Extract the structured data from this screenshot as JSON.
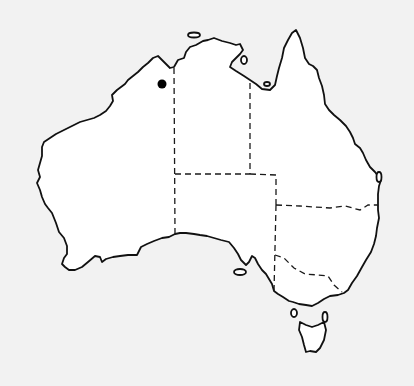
{
  "map": {
    "subject": "Australia outline with state borders",
    "background_color": "#f2f2f2",
    "land_color": "#ffffff",
    "outline_color": "#111111",
    "regions": [
      {
        "name": "Western Australia"
      },
      {
        "name": "Northern Territory"
      },
      {
        "name": "Queensland"
      },
      {
        "name": "South Australia"
      },
      {
        "name": "New South Wales"
      },
      {
        "name": "Victoria"
      },
      {
        "name": "Tasmania"
      }
    ],
    "markers": [
      {
        "label": "location-marker",
        "x": 162,
        "y": 84,
        "color": "#000000"
      }
    ]
  }
}
